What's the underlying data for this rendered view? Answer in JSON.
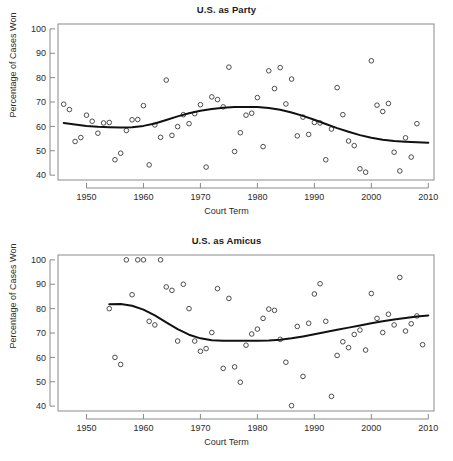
{
  "figure": {
    "panels": [
      {
        "key": "party",
        "title": "U.S. as Party",
        "xlabel": "Court Term",
        "ylabel": "Percentage of Cases Won"
      },
      {
        "key": "amicus",
        "title": "U.S. as Amicus",
        "xlabel": "Court Term",
        "ylabel": "Percentage of Cases Won"
      }
    ]
  },
  "chart_data": [
    {
      "type": "scatter",
      "title": "U.S. as Party",
      "xlabel": "Court Term",
      "ylabel": "Percentage of Cases Won",
      "xlim": [
        1945,
        2011
      ],
      "ylim": [
        38,
        102
      ],
      "xticks": [
        1950,
        1960,
        1970,
        1980,
        1990,
        2000,
        2010
      ],
      "yticks": [
        40,
        50,
        60,
        70,
        80,
        90,
        100
      ],
      "grid": false,
      "legend": null,
      "marker": "open-circle",
      "series": [
        {
          "name": "Percentage of cases won, U.S. as party",
          "points": [
            [
              1946,
              69.1
            ],
            [
              1947,
              66.9
            ],
            [
              1948,
              53.8
            ],
            [
              1949,
              55.4
            ],
            [
              1950,
              64.6
            ],
            [
              1951,
              62.1
            ],
            [
              1952,
              57.2
            ],
            [
              1953,
              61.4
            ],
            [
              1954,
              61.6
            ],
            [
              1955,
              46.3
            ],
            [
              1956,
              49.0
            ],
            [
              1957,
              58.3
            ],
            [
              1958,
              62.7
            ],
            [
              1959,
              62.8
            ],
            [
              1960,
              68.5
            ],
            [
              1961,
              44.2
            ],
            [
              1962,
              60.6
            ],
            [
              1963,
              55.5
            ],
            [
              1964,
              79.0
            ],
            [
              1965,
              56.3
            ],
            [
              1966,
              59.9
            ],
            [
              1967,
              64.8
            ],
            [
              1968,
              61.1
            ],
            [
              1969,
              65.2
            ],
            [
              1970,
              68.9
            ],
            [
              1971,
              43.3
            ],
            [
              1972,
              72.1
            ],
            [
              1973,
              71.0
            ],
            [
              1974,
              68.0
            ],
            [
              1975,
              84.3
            ],
            [
              1976,
              49.7
            ],
            [
              1977,
              57.4
            ],
            [
              1978,
              64.6
            ],
            [
              1979,
              65.4
            ],
            [
              1980,
              71.8
            ],
            [
              1981,
              51.7
            ],
            [
              1982,
              82.8
            ],
            [
              1983,
              75.5
            ],
            [
              1984,
              84.1
            ],
            [
              1985,
              69.2
            ],
            [
              1986,
              79.4
            ],
            [
              1987,
              56.1
            ],
            [
              1988,
              63.8
            ],
            [
              1989,
              56.7
            ],
            [
              1990,
              61.6
            ],
            [
              1991,
              61.4
            ],
            [
              1992,
              46.3
            ],
            [
              1993,
              58.9
            ],
            [
              1994,
              75.9
            ],
            [
              1995,
              64.8
            ],
            [
              1996,
              54.0
            ],
            [
              1997,
              52.1
            ],
            [
              1998,
              42.6
            ],
            [
              1999,
              41.2
            ],
            [
              2000,
              86.9
            ],
            [
              2001,
              68.7
            ],
            [
              2002,
              66.1
            ],
            [
              2003,
              69.4
            ],
            [
              2004,
              49.4
            ],
            [
              2005,
              41.7
            ],
            [
              2006,
              55.3
            ],
            [
              2007,
              47.4
            ],
            [
              2008,
              61.1
            ]
          ]
        }
      ],
      "smooth": {
        "name": "LOESS trend",
        "points": [
          [
            1946,
            61.4
          ],
          [
            1948,
            60.8
          ],
          [
            1950,
            60.2
          ],
          [
            1952,
            59.8
          ],
          [
            1954,
            59.6
          ],
          [
            1956,
            59.5
          ],
          [
            1958,
            59.6
          ],
          [
            1960,
            60.2
          ],
          [
            1962,
            61.2
          ],
          [
            1964,
            62.6
          ],
          [
            1966,
            64.1
          ],
          [
            1968,
            65.4
          ],
          [
            1970,
            66.4
          ],
          [
            1972,
            67.1
          ],
          [
            1974,
            67.6
          ],
          [
            1976,
            67.9
          ],
          [
            1978,
            68.0
          ],
          [
            1980,
            67.9
          ],
          [
            1982,
            67.5
          ],
          [
            1984,
            66.8
          ],
          [
            1986,
            65.7
          ],
          [
            1988,
            64.3
          ],
          [
            1990,
            62.7
          ],
          [
            1992,
            61.0
          ],
          [
            1994,
            59.3
          ],
          [
            1996,
            57.8
          ],
          [
            1998,
            56.4
          ],
          [
            2000,
            55.3
          ],
          [
            2002,
            54.5
          ],
          [
            2004,
            54.0
          ],
          [
            2006,
            53.7
          ],
          [
            2008,
            53.5
          ],
          [
            2010,
            53.3
          ]
        ]
      }
    },
    {
      "type": "scatter",
      "title": "U.S. as Amicus",
      "xlabel": "Court Term",
      "ylabel": "Percentage of Cases Won",
      "xlim": [
        1945,
        2011
      ],
      "ylim": [
        38,
        102
      ],
      "xticks": [
        1950,
        1960,
        1970,
        1980,
        1990,
        2000,
        2010
      ],
      "yticks": [
        40,
        50,
        60,
        70,
        80,
        90,
        100
      ],
      "grid": false,
      "legend": null,
      "marker": "open-circle",
      "series": [
        {
          "name": "Percentage of cases won, U.S. as amicus",
          "points": [
            [
              1954,
              80.0
            ],
            [
              1955,
              60.0
            ],
            [
              1956,
              57.1
            ],
            [
              1957,
              100.0
            ],
            [
              1958,
              85.7
            ],
            [
              1959,
              100.0
            ],
            [
              1960,
              100.0
            ],
            [
              1961,
              74.8
            ],
            [
              1962,
              73.3
            ],
            [
              1963,
              100.0
            ],
            [
              1964,
              88.9
            ],
            [
              1965,
              87.5
            ],
            [
              1966,
              66.7
            ],
            [
              1967,
              90.0
            ],
            [
              1968,
              80.0
            ],
            [
              1969,
              66.7
            ],
            [
              1970,
              62.5
            ],
            [
              1971,
              63.6
            ],
            [
              1972,
              70.2
            ],
            [
              1973,
              88.2
            ],
            [
              1974,
              55.5
            ],
            [
              1975,
              84.2
            ],
            [
              1976,
              56.1
            ],
            [
              1977,
              49.8
            ],
            [
              1978,
              65.0
            ],
            [
              1979,
              69.6
            ],
            [
              1980,
              71.6
            ],
            [
              1981,
              76.0
            ],
            [
              1982,
              79.8
            ],
            [
              1983,
              79.3
            ],
            [
              1984,
              67.4
            ],
            [
              1985,
              58.0
            ],
            [
              1986,
              40.2
            ],
            [
              1987,
              72.7
            ],
            [
              1988,
              52.2
            ],
            [
              1989,
              74.0
            ],
            [
              1990,
              86.0
            ],
            [
              1991,
              90.2
            ],
            [
              1992,
              74.8
            ],
            [
              1993,
              44.0
            ],
            [
              1994,
              60.8
            ],
            [
              1995,
              66.4
            ],
            [
              1996,
              64.0
            ],
            [
              1997,
              69.4
            ],
            [
              1998,
              71.2
            ],
            [
              1999,
              63.0
            ],
            [
              2000,
              86.2
            ],
            [
              2001,
              76.0
            ],
            [
              2002,
              70.2
            ],
            [
              2003,
              77.7
            ],
            [
              2004,
              73.3
            ],
            [
              2005,
              92.8
            ],
            [
              2006,
              70.8
            ],
            [
              2007,
              73.8
            ],
            [
              2008,
              77.0
            ],
            [
              2009,
              65.2
            ]
          ]
        }
      ],
      "smooth": {
        "name": "LOESS trend",
        "points": [
          [
            1954,
            81.8
          ],
          [
            1956,
            81.9
          ],
          [
            1958,
            81.2
          ],
          [
            1960,
            79.6
          ],
          [
            1962,
            77.2
          ],
          [
            1964,
            74.4
          ],
          [
            1966,
            71.6
          ],
          [
            1968,
            69.3
          ],
          [
            1970,
            67.8
          ],
          [
            1972,
            67.0
          ],
          [
            1974,
            66.8
          ],
          [
            1976,
            66.8
          ],
          [
            1978,
            66.8
          ],
          [
            1980,
            66.8
          ],
          [
            1982,
            66.9
          ],
          [
            1984,
            67.2
          ],
          [
            1986,
            67.8
          ],
          [
            1988,
            68.6
          ],
          [
            1990,
            69.5
          ],
          [
            1992,
            70.4
          ],
          [
            1994,
            71.3
          ],
          [
            1996,
            72.2
          ],
          [
            1998,
            73.1
          ],
          [
            2000,
            74.0
          ],
          [
            2002,
            74.8
          ],
          [
            2004,
            75.5
          ],
          [
            2006,
            76.2
          ],
          [
            2008,
            76.8
          ],
          [
            2010,
            77.2
          ]
        ]
      }
    }
  ]
}
